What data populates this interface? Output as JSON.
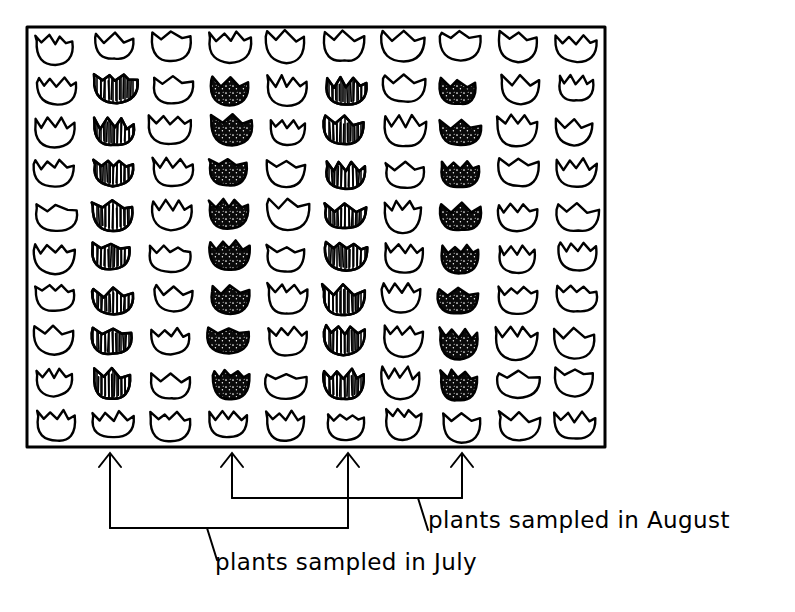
{
  "figure": {
    "kind": "hand-drawn-quadrat-diagram",
    "background_color": "#ffffff",
    "ink_color": "#000000"
  },
  "plot": {
    "name": "study-plot",
    "border": {
      "x": 27,
      "y": 27,
      "width": 578,
      "height": 420,
      "stroke_width": 3
    },
    "rows": 10,
    "columns": 10,
    "cell_width": 57.8,
    "cell_height": 42.0
  },
  "legend_symbols": {
    "outline": {
      "key": "o",
      "label": "unsampled plant",
      "fill": "none"
    },
    "hatched": {
      "key": "h",
      "label": "hatched plant",
      "fill": "vertical-hatch"
    },
    "solid": {
      "key": "b",
      "label": "solid plant",
      "fill": "#000000"
    }
  },
  "grid": {
    "legend": "o = outline flower, h = hatched flower, b = solid black flower",
    "rows": [
      [
        "o",
        "o",
        "o",
        "o",
        "o",
        "o",
        "o",
        "o",
        "o",
        "o"
      ],
      [
        "o",
        "h",
        "o",
        "b",
        "o",
        "h",
        "o",
        "b",
        "o",
        "o"
      ],
      [
        "o",
        "h",
        "o",
        "b",
        "o",
        "h",
        "o",
        "b",
        "o",
        "o"
      ],
      [
        "o",
        "h",
        "o",
        "b",
        "o",
        "h",
        "o",
        "b",
        "o",
        "o"
      ],
      [
        "o",
        "h",
        "o",
        "b",
        "o",
        "h",
        "o",
        "b",
        "o",
        "o"
      ],
      [
        "o",
        "h",
        "o",
        "b",
        "o",
        "h",
        "o",
        "b",
        "o",
        "o"
      ],
      [
        "o",
        "h",
        "o",
        "b",
        "o",
        "h",
        "o",
        "b",
        "o",
        "o"
      ],
      [
        "o",
        "h",
        "o",
        "b",
        "o",
        "h",
        "o",
        "b",
        "o",
        "o"
      ],
      [
        "o",
        "h",
        "o",
        "b",
        "o",
        "h",
        "o",
        "b",
        "o",
        "o"
      ],
      [
        "o",
        "o",
        "o",
        "o",
        "o",
        "o",
        "o",
        "o",
        "o",
        "o"
      ]
    ]
  },
  "annotations": {
    "arrows": [
      {
        "name": "arrow-column-2",
        "tip_x": 110,
        "tip_y": 451,
        "tail_y": 528,
        "group": "july"
      },
      {
        "name": "arrow-column-4",
        "tip_x": 232,
        "tip_y": 451,
        "tail_y": 498,
        "group": "august"
      },
      {
        "name": "arrow-column-6",
        "tip_x": 348,
        "tip_y": 451,
        "tail_y": 528,
        "group": "july"
      },
      {
        "name": "arrow-column-8",
        "tip_x": 462,
        "tip_y": 451,
        "tail_y": 498,
        "group": "august"
      }
    ],
    "brackets": [
      {
        "name": "july-bracket",
        "x1": 110,
        "x2": 348,
        "y": 528,
        "leader_x": 207,
        "leader_y": 560
      },
      {
        "name": "august-bracket",
        "x1": 232,
        "x2": 462,
        "y": 498,
        "leader_x": 418,
        "leader_y": 530
      }
    ],
    "labels": {
      "july": "plants sampled in July",
      "august": "plants sampled in August"
    },
    "label_positions": {
      "july": {
        "x": 215,
        "y": 570
      },
      "august": {
        "x": 428,
        "y": 528
      }
    }
  }
}
